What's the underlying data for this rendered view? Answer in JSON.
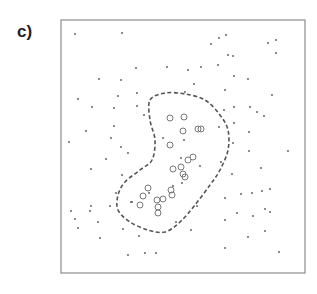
{
  "panel": {
    "label": "c)"
  },
  "colors": {
    "frame": "#8c8c8c",
    "dot": "#555555",
    "circle": "#777777",
    "contour": "#555555",
    "background": "#ffffff"
  },
  "frame": {
    "x": 61,
    "y": 20,
    "width": 244,
    "height": 253
  },
  "chart_data": {
    "type": "scatter",
    "title": "c)",
    "xlabel": "",
    "ylabel": "",
    "grid": false,
    "legend": null,
    "coordinate_space": "pixel coordinates within 317x294 image; frame spans x 61-305, y 20-273",
    "series": [
      {
        "name": "background points",
        "marker": "dot",
        "points": [
          [
            75,
            34
          ],
          [
            122,
            33
          ],
          [
            136,
            68
          ],
          [
            99,
            79
          ],
          [
            121,
            80
          ],
          [
            78,
            99
          ],
          [
            118,
            96
          ],
          [
            137,
            93
          ],
          [
            92,
            107
          ],
          [
            114,
            108
          ],
          [
            137,
            106
          ],
          [
            114,
            126
          ],
          [
            86,
            131
          ],
          [
            111,
            138
          ],
          [
            69,
            142
          ],
          [
            121,
            147
          ],
          [
            128,
            153
          ],
          [
            106,
            159
          ],
          [
            91,
            169
          ],
          [
            122,
            175
          ],
          [
            116,
            193
          ],
          [
            91,
            206
          ],
          [
            71,
            211
          ],
          [
            90,
            211
          ],
          [
            110,
            206
          ],
          [
            75,
            219
          ],
          [
            78,
            228
          ],
          [
            98,
            222
          ],
          [
            132,
            202
          ],
          [
            123,
            229
          ],
          [
            100,
            238
          ],
          [
            139,
            236
          ],
          [
            128,
            255
          ],
          [
            145,
            253
          ],
          [
            156,
            253
          ],
          [
            226,
            35
          ],
          [
            219,
            38
          ],
          [
            211,
            44
          ],
          [
            268,
            43
          ],
          [
            276,
            40
          ],
          [
            276,
            53
          ],
          [
            228,
            55
          ],
          [
            233,
            56
          ],
          [
            188,
            70
          ],
          [
            201,
            67
          ],
          [
            218,
            65
          ],
          [
            167,
            67
          ],
          [
            194,
            84
          ],
          [
            234,
            76
          ],
          [
            248,
            79
          ],
          [
            225,
            90
          ],
          [
            272,
            95
          ],
          [
            185,
            92
          ],
          [
            224,
            110
          ],
          [
            234,
            107
          ],
          [
            250,
            107
          ],
          [
            257,
            112
          ],
          [
            264,
            116
          ],
          [
            234,
            123
          ],
          [
            249,
            132
          ],
          [
            233,
            143
          ],
          [
            249,
            151
          ],
          [
            288,
            151
          ],
          [
            232,
            174
          ],
          [
            261,
            168
          ],
          [
            225,
            198
          ],
          [
            241,
            194
          ],
          [
            252,
            193
          ],
          [
            262,
            191
          ],
          [
            270,
            189
          ],
          [
            237,
            213
          ],
          [
            253,
            216
          ],
          [
            265,
            209
          ],
          [
            270,
            212
          ],
          [
            225,
            220
          ],
          [
            248,
            237
          ],
          [
            265,
            231
          ],
          [
            225,
            248
          ],
          [
            279,
            252
          ],
          [
            144,
            115
          ],
          [
            163,
            138
          ],
          [
            184,
            140
          ],
          [
            181,
            158
          ],
          [
            200,
            166
          ],
          [
            219,
            127
          ],
          [
            221,
            162
          ],
          [
            131,
            202
          ],
          [
            149,
            193
          ],
          [
            173,
            186
          ],
          [
            182,
            183
          ],
          [
            176,
            222
          ],
          [
            197,
            206
          ],
          [
            191,
            230
          ]
        ]
      },
      {
        "name": "cluster points",
        "marker": "open-circle",
        "points": [
          [
            170,
            118
          ],
          [
            184,
            117
          ],
          [
            183,
            131
          ],
          [
            198,
            129
          ],
          [
            201,
            129
          ],
          [
            170,
            145
          ],
          [
            188,
            160
          ],
          [
            193,
            157
          ],
          [
            173,
            169
          ],
          [
            181,
            167
          ],
          [
            183,
            174
          ],
          [
            185,
            177
          ],
          [
            148,
            188
          ],
          [
            143,
            196
          ],
          [
            140,
            205
          ],
          [
            157,
            200
          ],
          [
            163,
            199
          ],
          [
            171,
            190
          ],
          [
            172,
            195
          ],
          [
            158,
            207
          ],
          [
            158,
            213
          ]
        ]
      }
    ],
    "annotations": [
      {
        "type": "dashed-contour",
        "description": "closed kidney-shaped dashed boundary enclosing the open-circle cluster",
        "path": [
          [
            150,
            100
          ],
          [
            165,
            93
          ],
          [
            185,
            94
          ],
          [
            205,
            100
          ],
          [
            220,
            115
          ],
          [
            228,
            130
          ],
          [
            228,
            150
          ],
          [
            220,
            170
          ],
          [
            210,
            185
          ],
          [
            195,
            205
          ],
          [
            180,
            222
          ],
          [
            165,
            232
          ],
          [
            148,
            230
          ],
          [
            130,
            222
          ],
          [
            118,
            210
          ],
          [
            118,
            195
          ],
          [
            125,
            182
          ],
          [
            140,
            170
          ],
          [
            152,
            160
          ],
          [
            155,
            140
          ],
          [
            150,
            120
          ]
        ]
      }
    ]
  }
}
